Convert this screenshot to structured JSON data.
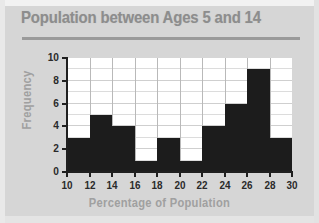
{
  "chart_data": {
    "type": "bar",
    "title": "Population between Ages 5 and 14",
    "xlabel": "Percentage of Population",
    "ylabel": "Frequency",
    "bin_edges": [
      10,
      12,
      14,
      16,
      18,
      20,
      22,
      24,
      26,
      28,
      30
    ],
    "categories": [
      "10-12",
      "12-14",
      "14-16",
      "16-18",
      "18-20",
      "20-22",
      "22-24",
      "24-26",
      "26-28",
      "28-30"
    ],
    "values": [
      3,
      5,
      4,
      1,
      3,
      1,
      4,
      6,
      9,
      3
    ],
    "xlim": [
      10,
      30
    ],
    "ylim": [
      0,
      10
    ],
    "x_ticks": [
      "10",
      "12",
      "14",
      "16",
      "18",
      "20",
      "22",
      "24",
      "26",
      "28",
      "30"
    ],
    "y_ticks": [
      "0",
      "2",
      "4",
      "6",
      "8",
      "10"
    ],
    "y_minor_gridlines": [
      1,
      3,
      5,
      7,
      9
    ],
    "grid": true,
    "legend": "none",
    "bar_color": "#1c1c1c",
    "plot_bg": "#ffffff",
    "page_bg": "#d6d6d6",
    "title_color": "#8d8d8d",
    "axis_label_color": "#a0a0a0",
    "tick_label_color": "#2a2a2a"
  }
}
